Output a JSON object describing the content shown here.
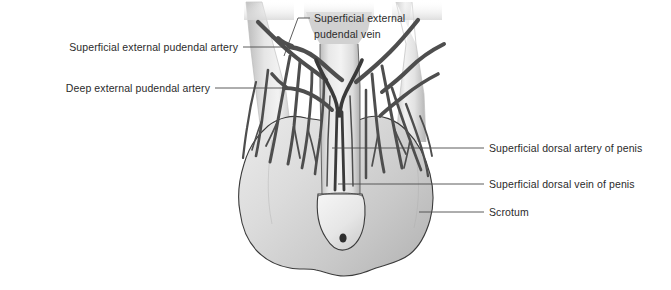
{
  "figure": {
    "background_color": "#ffffff",
    "width": 671,
    "height": 290
  },
  "palette": {
    "text": "#2b2b2b",
    "leader_line": "#4a4a4a",
    "outline": "#3b3b3b",
    "vessel": "#4e4e4e",
    "vessel_dark": "#3a3a3a",
    "tissue_light": "#f0f0f0",
    "tissue_mid": "#cfcfcf",
    "tissue_dark": "#a8a8a8",
    "scrotum_light": "#e2e2e2",
    "scrotum_mid": "#c4c4c4",
    "glans_light": "#ededed"
  },
  "labels": [
    {
      "id": "superficial-external-pudendal-artery",
      "text": "Superficial external pudendal artery",
      "side": "left",
      "text_x": 238,
      "text_y": 51,
      "leader": "M 243 47 L 288 47"
    },
    {
      "id": "deep-external-pudendal-artery",
      "text": "Deep external pudendal artery",
      "side": "left",
      "text_x": 210,
      "text_y": 92,
      "leader": "M 215 88 L 283 88"
    },
    {
      "id": "superficial-external-pudendal-vein",
      "text_line1": "Superficial external pudendal vein",
      "text": "Superficial external",
      "text2": "pudendal vein",
      "side": "right",
      "text_x": 314,
      "text_y": 22,
      "text2_x": 314,
      "text2_y": 38,
      "leader": "M 310 18 L 298 18 L 283 57"
    },
    {
      "id": "superficial-dorsal-artery-of-penis",
      "text": "Superficial dorsal artery of penis",
      "side": "right",
      "text_x": 489,
      "text_y": 152,
      "leader": "M 484 148 L 332 148"
    },
    {
      "id": "superficial-dorsal-vein-of-penis",
      "text": "Superficial dorsal vein of penis",
      "side": "right",
      "text_x": 489,
      "text_y": 188,
      "leader": "M 484 184 L 337 184"
    },
    {
      "id": "scrotum",
      "text": "Scrotum",
      "side": "right",
      "text_x": 489,
      "text_y": 216,
      "leader": "M 484 212 L 419 212"
    }
  ],
  "structures": [
    {
      "id": "scrotum-sac",
      "name": "scrotum"
    },
    {
      "id": "penis-shaft",
      "name": "body of penis"
    },
    {
      "id": "glans-penis",
      "name": "glans penis"
    },
    {
      "id": "external-urethral-meatus",
      "name": "external urethral meatus"
    },
    {
      "id": "left-inguinal-limb",
      "name": "left inguinal region"
    },
    {
      "id": "right-inguinal-limb",
      "name": "right inguinal region"
    }
  ]
}
